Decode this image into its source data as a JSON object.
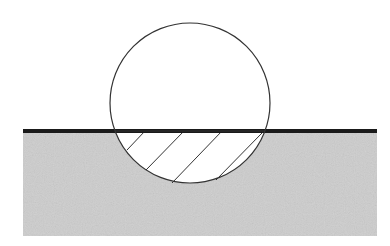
{
  "diagram": {
    "colors": {
      "background": "#ffffff",
      "ground_fill": "#cdcdcd",
      "surface_line": "#1a1a1a",
      "outline": "#333333",
      "hatch": "#333333"
    },
    "ground": {
      "x": 23,
      "y": 131,
      "width": 354,
      "height": 105
    },
    "surface_line": {
      "x1": 23,
      "x2": 377,
      "y": 131,
      "thickness": 4
    },
    "sphere": {
      "cx": 190,
      "cy": 103,
      "r": 80
    },
    "hatch_lines": [
      {
        "x1": 127,
        "y1": 150,
        "x2": 145,
        "y2": 131
      },
      {
        "x1": 146,
        "y1": 170,
        "x2": 184,
        "y2": 131
      },
      {
        "x1": 172,
        "y1": 183,
        "x2": 222,
        "y2": 131
      },
      {
        "x1": 216,
        "y1": 180,
        "x2": 262,
        "y2": 133
      }
    ]
  }
}
